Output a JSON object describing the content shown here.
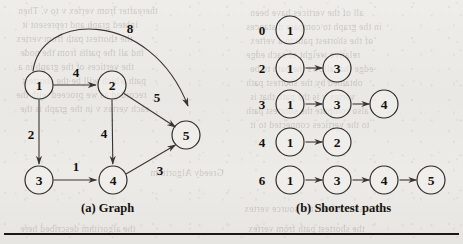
{
  "figure": {
    "panel_a": {
      "caption": "(a) Graph",
      "nodes": [
        {
          "id": "1",
          "label": "1",
          "cx": 39,
          "cy": 85,
          "r": 14
        },
        {
          "id": "2",
          "label": "2",
          "cx": 112,
          "cy": 85,
          "r": 14
        },
        {
          "id": "3",
          "label": "3",
          "cx": 39,
          "cy": 180,
          "r": 14
        },
        {
          "id": "4",
          "label": "4",
          "cx": 113,
          "cy": 180,
          "r": 14
        },
        {
          "id": "5",
          "label": "5",
          "cx": 186,
          "cy": 135,
          "r": 14
        }
      ],
      "edges": [
        {
          "from": "1",
          "to": "2",
          "weight": "4",
          "lx": 76,
          "ly": 72
        },
        {
          "from": "1",
          "to": "3",
          "weight": "2",
          "lx": 31,
          "ly": 134
        },
        {
          "from": "1",
          "to": "5",
          "weight": "8",
          "lx": 130,
          "ly": 28,
          "curved": true
        },
        {
          "from": "2",
          "to": "4",
          "weight": "4",
          "lx": 104,
          "ly": 133
        },
        {
          "from": "2",
          "to": "5",
          "weight": "5",
          "lx": 157,
          "ly": 97
        },
        {
          "from": "3",
          "to": "4",
          "weight": "1",
          "lx": 76,
          "ly": 166
        },
        {
          "from": "4",
          "to": "5",
          "weight": "3",
          "lx": 160,
          "ly": 170
        }
      ]
    },
    "panel_b": {
      "caption": "(b) Shortest paths",
      "rows": [
        {
          "distance": "0",
          "path": [
            "1"
          ]
        },
        {
          "distance": "2",
          "path": [
            "1",
            "3"
          ]
        },
        {
          "distance": "3",
          "path": [
            "1",
            "3",
            "4"
          ]
        },
        {
          "distance": "4",
          "path": [
            "1",
            "2"
          ]
        },
        {
          "distance": "6",
          "path": [
            "1",
            "3",
            "4",
            "5"
          ]
        }
      ],
      "layout": {
        "distance_x": 262,
        "first_node_x": 290,
        "node_spacing": 47,
        "node_radius": 14,
        "row_y": [
          30,
          68,
          104,
          142,
          180
        ]
      }
    }
  },
  "colors": {
    "paper": "#eceae6",
    "ink": "#15120f",
    "stroke": "#3a3532",
    "rule": "#1a1714"
  },
  "bleed_text": [
    {
      "text": "thereafter from vertex v to v. Then",
      "x": 18,
      "y": 6
    },
    {
      "text": "ighted graph and represent it",
      "x": 22,
      "y": 20
    },
    {
      "text": "the shortest path from vertex",
      "x": 16,
      "y": 34
    },
    {
      "text": "ind all the paths from the node",
      "x": 20,
      "y": 48
    },
    {
      "text": "the vertices of the graph in a",
      "x": 18,
      "y": 62
    },
    {
      "text": "path which will be the shortest",
      "x": 22,
      "y": 76
    },
    {
      "text": "recorded as we proceed with the",
      "x": 16,
      "y": 90
    },
    {
      "text": "each vertex v in the graph is the",
      "x": 20,
      "y": 104
    },
    {
      "text": "Greedy Algorithm",
      "x": 150,
      "y": 168
    },
    {
      "text": "the algorithm described here",
      "x": 20,
      "y": 224
    },
    {
      "text": "all of the vertices have been",
      "x": 250,
      "y": 8
    },
    {
      "text": "in the graph to compare distances",
      "x": 246,
      "y": 22
    },
    {
      "text": "of the shortest path to a vertex",
      "x": 250,
      "y": 36
    },
    {
      "text": "relative weight of each edge",
      "x": 246,
      "y": 50
    },
    {
      "text": "edge that allows the path to be",
      "x": 250,
      "y": 64
    },
    {
      "text": "obtained by the shortest path",
      "x": 246,
      "y": 78
    },
    {
      "text": "vertex v is the path that is",
      "x": 250,
      "y": 92
    },
    {
      "text": "also compute the shortest path",
      "x": 246,
      "y": 106
    },
    {
      "text": "to the vertices connected to it",
      "x": 250,
      "y": 120
    },
    {
      "text": "the distance from the source vertex",
      "x": 244,
      "y": 204
    },
    {
      "text": "the shortest path from vertex",
      "x": 248,
      "y": 224
    }
  ]
}
